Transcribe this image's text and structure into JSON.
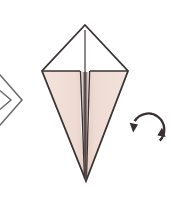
{
  "figure": {
    "title": "Origami fold step - kite base with turn over symbol",
    "canvas": {
      "width": 171,
      "height": 201
    },
    "background_color": "#ffffff"
  },
  "colors": {
    "background": "#ffffff",
    "paper_front": "#f0dcd4",
    "paper_back": "#ffffff",
    "outline": "#3a3233",
    "crease_shadow": "#5d4a48",
    "center_line": "#6e5f5f",
    "prev_step_outline": "#6b6b6b",
    "arrow": "#3a3033"
  },
  "previous_step": {
    "label": "partial diamond from previous step",
    "chevron_outer": "-6,68 22,100 -6,132",
    "chevron_inner": "-14,76 12,100 -14,124",
    "stroke_width": 1.6
  },
  "model": {
    "label": "kite base, point down",
    "apex_top": {
      "x": 85,
      "y": 25
    },
    "corner_left": {
      "x": 42,
      "y": 71
    },
    "corner_right": {
      "x": 128,
      "y": 71
    },
    "tip_bottom": {
      "x": 86,
      "y": 181
    },
    "outline_polygon": "85,25 128,71 86,181 42,71",
    "left_flap_polygon": "42,71 80,71 80,118 84,178",
    "right_flap_polygon": "128,71 90,71 90,118 87,178",
    "top_left_panel_polygon": "85,25 80,71 42,71",
    "top_right_panel_polygon": "85,25 90,71 128,71",
    "center_crease_top": {
      "x": 85,
      "y": 30
    },
    "center_crease_bottom": {
      "x": 86,
      "y": 181
    },
    "horizontal_fold_left": "42,71 80,71",
    "horizontal_fold_right": "90,71 128,71",
    "stroke_width": 1.8,
    "fold_stroke_width": 1.4
  },
  "turn_over_symbol": {
    "label": "rotate / turn over arrow",
    "center": {
      "x": 148,
      "y": 130
    },
    "radius": 16,
    "stroke_width": 2.2,
    "arrowhead_left": {
      "x": 133,
      "y": 128,
      "direction": "down"
    },
    "arrowhead_right": {
      "x": 163,
      "y": 132,
      "direction": "up"
    },
    "arc_gap_degrees": 28
  }
}
